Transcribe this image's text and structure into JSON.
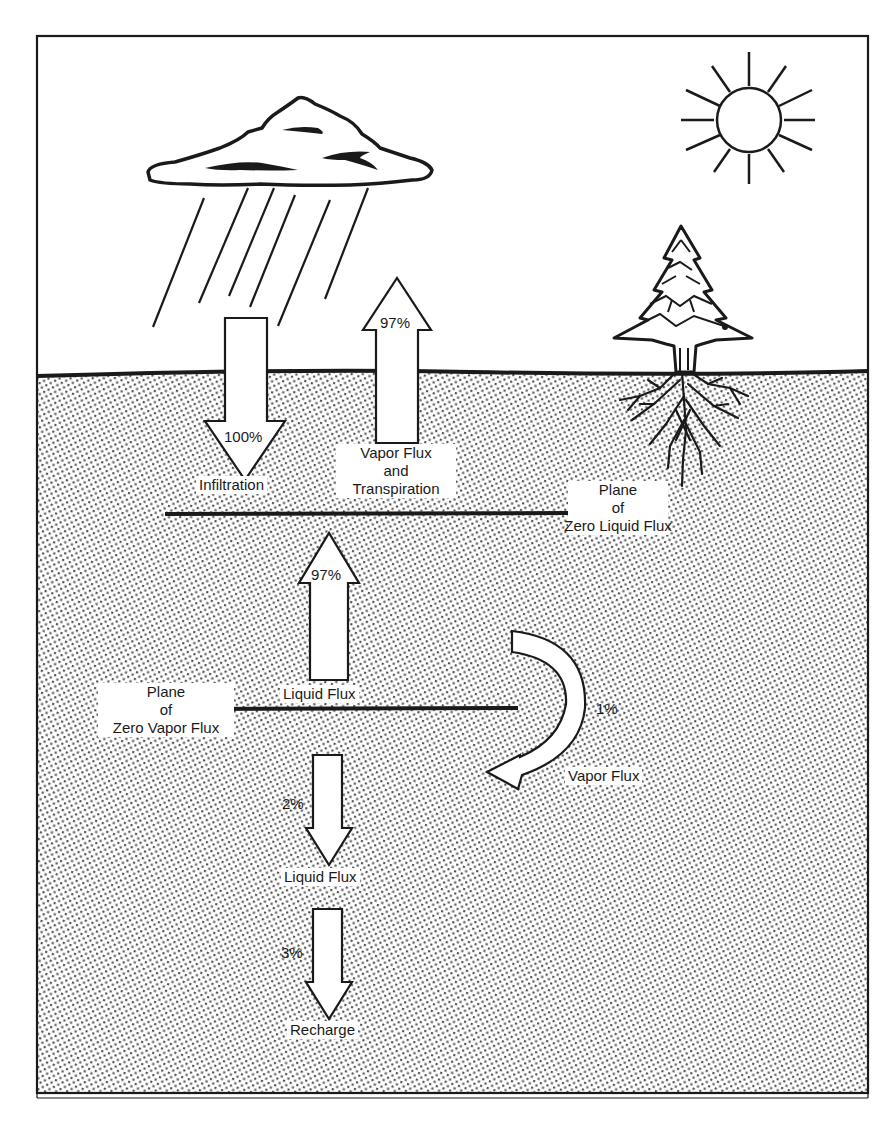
{
  "diagram": {
    "type": "water-balance-cross-section",
    "colors": {
      "ink": "#1a1a1a",
      "paper": "#ffffff",
      "stipple": "#555555"
    },
    "icons": {
      "sun": "sun-icon",
      "cloud": "rain-cloud-icon",
      "tree": "conifer-tree-icon"
    },
    "arrows": {
      "infiltration": {
        "percent": "100%",
        "label": "Infiltration",
        "direction": "down"
      },
      "vapor_transpiration": {
        "percent": "97%",
        "label_line1": "Vapor Flux",
        "label_line2": "and",
        "label_line3": "Transpiration",
        "direction": "up"
      },
      "liquid_flux_up": {
        "percent": "97%",
        "label": "Liquid Flux",
        "direction": "up"
      },
      "vapor_flux_curved": {
        "percent": "1%",
        "label": "Vapor Flux",
        "direction": "curved-down"
      },
      "liquid_flux_down": {
        "percent": "2%",
        "label": "Liquid Flux",
        "direction": "down"
      },
      "recharge": {
        "percent": "3%",
        "label": "Recharge",
        "direction": "down"
      }
    },
    "planes": {
      "zero_liquid_flux": {
        "line1": "Plane",
        "line2": "of",
        "line3": "Zero Liquid Flux"
      },
      "zero_vapor_flux": {
        "line1": "Plane",
        "line2": "of",
        "line3": "Zero Vapor Flux"
      }
    }
  }
}
